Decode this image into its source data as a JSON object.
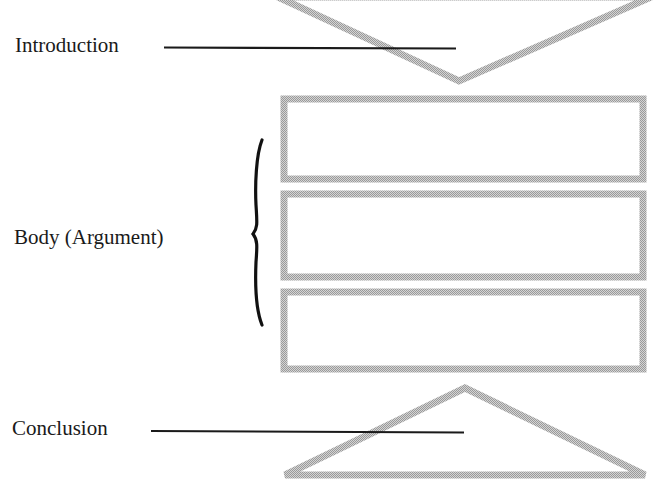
{
  "diagram": {
    "title": "",
    "type": "essay-structure",
    "labels": {
      "introduction": "Introduction",
      "body": "Body (Argument)",
      "conclusion": "Conclusion"
    },
    "shapes": {
      "introduction": "inverted-triangle",
      "body": [
        "rectangle",
        "rectangle",
        "rectangle"
      ],
      "conclusion": "triangle"
    },
    "colors": {
      "shape_stroke": "#b9b9b9",
      "leader_line": "#1a1a1a",
      "brace": "#111111",
      "text": "#1a1a1a",
      "background": "#ffffff"
    }
  }
}
